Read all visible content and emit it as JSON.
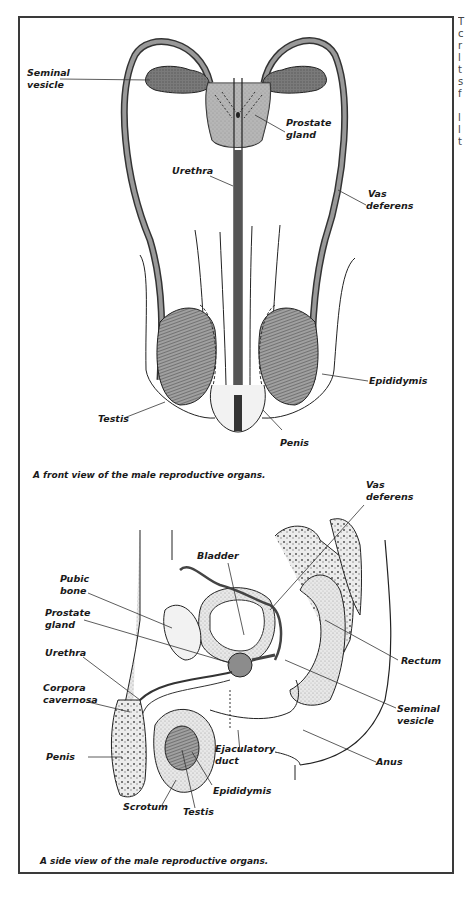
{
  "figure_front": {
    "caption": "A front view of the male reproductive organs.",
    "labels": {
      "seminal_vesicle_1": "Seminal",
      "seminal_vesicle_2": "vesicle",
      "prostate_gland_1": "Prostate",
      "prostate_gland_2": "gland",
      "urethra": "Urethra",
      "vas_deferens_1": "Vas",
      "vas_deferens_2": "deferens",
      "epididymis": "Epididymis",
      "testis": "Testis",
      "penis": "Penis"
    }
  },
  "figure_side": {
    "caption": "A side view of the male reproductive organs.",
    "labels": {
      "vas_deferens_1": "Vas",
      "vas_deferens_2": "deferens",
      "bladder": "Bladder",
      "pubic_bone_1": "Pubic",
      "pubic_bone_2": "bone",
      "prostate_gland_1": "Prostate",
      "prostate_gland_2": "gland",
      "urethra": "Urethra",
      "corpora_cavernosa_1": "Corpora",
      "corpora_cavernosa_2": "cavernosa",
      "rectum": "Rectum",
      "seminal_vesicle_1": "Seminal",
      "seminal_vesicle_2": "vesicle",
      "penis": "Penis",
      "ejaculatory_duct_1": "Ejaculatory",
      "ejaculatory_duct_2": "duct",
      "anus": "Anus",
      "epididymis": "Epididymis",
      "scrotum": "Scrotum",
      "testis": "Testis"
    }
  },
  "edge_text_fragments": [
    "T",
    "c",
    "r",
    "l",
    "t",
    "s",
    "f",
    "",
    "l",
    "l",
    "t",
    "r",
    "r",
    "r"
  ],
  "colors": {
    "ink": "#1a1a1a",
    "organ_fill": "#8c8c8c",
    "light_fill": "#e4e4e4",
    "frame": "#3a3a3a"
  }
}
